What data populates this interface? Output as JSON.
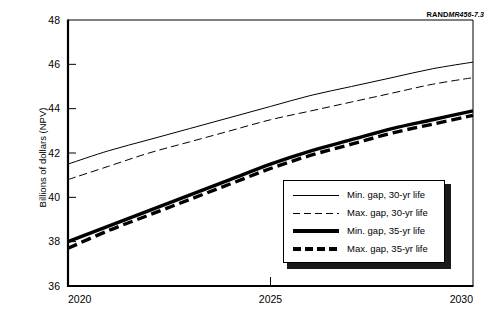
{
  "figure": {
    "rand_label": "RAND",
    "rand_number": "MR456-7.3"
  },
  "chart_data": {
    "type": "line",
    "title": "",
    "xlabel": "",
    "ylabel": "Billions of dollars (NPV)",
    "xlim": [
      2020,
      2030
    ],
    "ylim": [
      36,
      48
    ],
    "xticks": [
      "2020",
      "2025",
      "2030"
    ],
    "xtick_values": [
      2020,
      2025,
      2030
    ],
    "yticks": [
      "36",
      "38",
      "40",
      "42",
      "44",
      "46",
      "48"
    ],
    "ytick_values": [
      36,
      38,
      40,
      42,
      44,
      46,
      48
    ],
    "grid": false,
    "legend_position": "lower right",
    "x": [
      2020,
      2021,
      2022,
      2023,
      2024,
      2025,
      2026,
      2027,
      2028,
      2029,
      2030
    ],
    "series": [
      {
        "name": "Min. gap, 30-yr life",
        "style": "thin-solid",
        "values": [
          41.5,
          42.1,
          42.6,
          43.1,
          43.6,
          44.1,
          44.6,
          45.0,
          45.4,
          45.8,
          46.1
        ]
      },
      {
        "name": "Max. gap, 30-yr life",
        "style": "thin-dash",
        "values": [
          40.8,
          41.4,
          42.0,
          42.5,
          43.0,
          43.5,
          43.9,
          44.3,
          44.7,
          45.1,
          45.4
        ]
      },
      {
        "name": "Min. gap, 35-yr life",
        "style": "thick-solid",
        "values": [
          38.0,
          38.7,
          39.4,
          40.1,
          40.8,
          41.5,
          42.1,
          42.6,
          43.1,
          43.5,
          43.9
        ]
      },
      {
        "name": "Max. gap, 35-yr life",
        "style": "thick-dash",
        "values": [
          37.7,
          38.5,
          39.2,
          39.9,
          40.6,
          41.3,
          41.9,
          42.4,
          42.9,
          43.3,
          43.7
        ]
      }
    ]
  },
  "legend": {
    "items": [
      {
        "label": "Min. gap, 30-yr life",
        "style": "thin-solid"
      },
      {
        "label": "Max. gap, 30-yr life",
        "style": "thin-dash"
      },
      {
        "label": "Min. gap, 35-yr life",
        "style": "thick-solid"
      },
      {
        "label": "Max. gap, 35-yr life",
        "style": "thick-dash"
      }
    ]
  }
}
